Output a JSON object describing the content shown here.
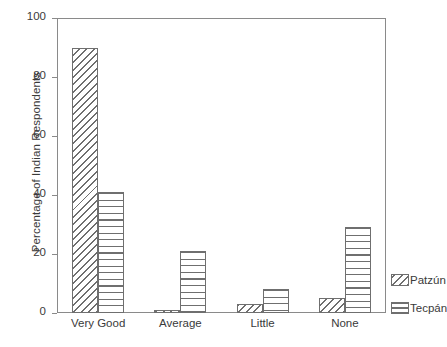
{
  "chart_data": {
    "type": "bar",
    "title": "",
    "subtitle": "",
    "xlabel": "",
    "ylabel": "Percentage of Indian Respondents",
    "categories": [
      "Very Good",
      "Average",
      "Little",
      "None"
    ],
    "series": [
      {
        "name": "Patzún",
        "pattern": "diagonal-hatch",
        "values": [
          90,
          1,
          3,
          5
        ]
      },
      {
        "name": "Tecpán",
        "pattern": "horizontal-lines",
        "values": [
          41,
          21,
          8,
          29
        ]
      }
    ],
    "ylim": [
      0,
      100
    ],
    "yticks": [
      0,
      20,
      40,
      60,
      80,
      100
    ],
    "ytick_labels": [
      "0",
      "20",
      "40",
      "60",
      "80",
      "100"
    ],
    "grid": false,
    "legend_position": "right-outside",
    "colors": {
      "line": "#6f6f6f",
      "frame": "#8a8a8a",
      "text": "#3a3a3a",
      "background": "#ffffff"
    }
  },
  "legend": {
    "entries": [
      {
        "label": "Patzún"
      },
      {
        "label": "Tecpán"
      }
    ]
  }
}
